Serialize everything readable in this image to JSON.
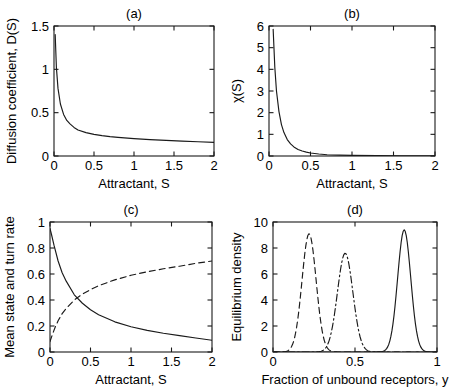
{
  "figure": {
    "background": "#ffffff",
    "line_color": "#1a1a1a",
    "axis_color": "#1a1a1a"
  },
  "chart_data": [
    {
      "id": "panel-a",
      "type": "line",
      "title": "(a)",
      "xlabel": "Attractant, S",
      "ylabel": "Diffusion coefficient, D(S)",
      "xlim": [
        0,
        2
      ],
      "ylim": [
        0,
        1.5
      ],
      "xticks": [
        0,
        0.5,
        1,
        1.5,
        2
      ],
      "xticklabels": [
        "0",
        "0.5",
        "1",
        "1.5",
        "2"
      ],
      "yticks": [
        0,
        0.5,
        1,
        1.5
      ],
      "yticklabels": [
        "0",
        "0.5",
        "1",
        "1.5"
      ],
      "grid": false,
      "legend": "none",
      "series": [
        {
          "name": "D(S)",
          "style": "solid",
          "x": [
            0.015,
            0.03,
            0.05,
            0.08,
            0.12,
            0.16,
            0.2,
            0.25,
            0.3,
            0.4,
            0.5,
            0.6,
            0.7,
            0.8,
            1.0,
            1.2,
            1.4,
            1.6,
            1.8,
            2.0
          ],
          "y": [
            1.4,
            1.02,
            0.78,
            0.6,
            0.48,
            0.41,
            0.37,
            0.33,
            0.3,
            0.27,
            0.25,
            0.235,
            0.224,
            0.215,
            0.2,
            0.189,
            0.18,
            0.172,
            0.165,
            0.158
          ]
        }
      ]
    },
    {
      "id": "panel-b",
      "type": "line",
      "title": "(b)",
      "xlabel": "Attractant, S",
      "ylabel": "χ(S)",
      "xlim": [
        0,
        2
      ],
      "ylim": [
        0,
        6
      ],
      "xticks": [
        0,
        0.5,
        1,
        1.5,
        2
      ],
      "xticklabels": [
        "0",
        "0.5",
        "1",
        "1.5",
        "2"
      ],
      "yticks": [
        0,
        1,
        2,
        3,
        4,
        5,
        6
      ],
      "yticklabels": [
        "0",
        "1",
        "2",
        "3",
        "4",
        "5",
        "6"
      ],
      "grid": false,
      "legend": "none",
      "series": [
        {
          "name": "chi(S)",
          "style": "solid",
          "x": [
            0.05,
            0.07,
            0.09,
            0.12,
            0.15,
            0.18,
            0.22,
            0.26,
            0.3,
            0.35,
            0.4,
            0.45,
            0.5,
            0.6,
            0.7,
            0.85,
            1.0,
            1.3,
            1.6,
            2.0
          ],
          "y": [
            5.85,
            4.1,
            3.0,
            2.05,
            1.45,
            1.08,
            0.76,
            0.56,
            0.42,
            0.3,
            0.23,
            0.18,
            0.14,
            0.09,
            0.06,
            0.04,
            0.03,
            0.015,
            0.01,
            0.005
          ]
        }
      ]
    },
    {
      "id": "panel-c",
      "type": "line",
      "title": "(c)",
      "xlabel": "Attractant, S",
      "ylabel": "Mean state and turn rate",
      "xlim": [
        0,
        2
      ],
      "ylim": [
        0,
        1
      ],
      "xticks": [
        0,
        0.5,
        1,
        1.5,
        2
      ],
      "xticklabels": [
        "0",
        "0.5",
        "1",
        "1.5",
        "2"
      ],
      "yticks": [
        0,
        0.2,
        0.4,
        0.6,
        0.8,
        1
      ],
      "yticklabels": [
        "0",
        "0.2",
        "0.4",
        "0.6",
        "0.8",
        "1"
      ],
      "grid": false,
      "legend": "none",
      "crossing_point": [
        0.3,
        0.38
      ],
      "series": [
        {
          "name": "turn rate",
          "style": "solid",
          "x": [
            0.0,
            0.02,
            0.05,
            0.1,
            0.15,
            0.2,
            0.3,
            0.4,
            0.5,
            0.6,
            0.8,
            1.0,
            1.2,
            1.4,
            1.6,
            1.8,
            2.0
          ],
          "y": [
            0.95,
            0.9,
            0.82,
            0.7,
            0.61,
            0.545,
            0.44,
            0.375,
            0.325,
            0.287,
            0.232,
            0.194,
            0.166,
            0.144,
            0.126,
            0.108,
            0.09
          ]
        },
        {
          "name": "mean state",
          "style": "dashed",
          "x": [
            0.0,
            0.03,
            0.06,
            0.1,
            0.15,
            0.2,
            0.3,
            0.4,
            0.5,
            0.6,
            0.8,
            1.0,
            1.2,
            1.4,
            1.6,
            1.8,
            2.0
          ],
          "y": [
            0.08,
            0.135,
            0.185,
            0.24,
            0.295,
            0.335,
            0.4,
            0.445,
            0.48,
            0.51,
            0.555,
            0.59,
            0.617,
            0.64,
            0.66,
            0.682,
            0.7
          ]
        }
      ]
    },
    {
      "id": "panel-d",
      "type": "line",
      "title": "(d)",
      "xlabel": "Fraction of unbound receptors, y",
      "ylabel": "Equilibrium density",
      "xlim": [
        0,
        1
      ],
      "ylim": [
        0,
        10
      ],
      "xticks": [
        0,
        0.5,
        1
      ],
      "xticklabels": [
        "0",
        "0.5",
        "1"
      ],
      "yticks": [
        0,
        2,
        4,
        6,
        8,
        10
      ],
      "yticklabels": [
        "0",
        "2",
        "4",
        "6",
        "8",
        "10"
      ],
      "grid": false,
      "legend": "none",
      "series": [
        {
          "name": "low attractant",
          "style": "dashed",
          "peak_x": 0.22,
          "peak_y": 9.1,
          "sigma": 0.043
        },
        {
          "name": "medium attractant",
          "style": "dashdot",
          "peak_x": 0.44,
          "peak_y": 7.6,
          "sigma": 0.047
        },
        {
          "name": "high attractant",
          "style": "solid",
          "peak_x": 0.8,
          "peak_y": 9.4,
          "sigma": 0.04
        }
      ]
    }
  ]
}
